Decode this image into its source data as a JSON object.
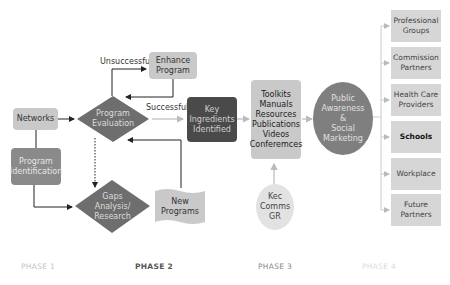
{
  "diagram": {
    "phase1": {
      "networks": "Networks",
      "program_identification": [
        "Program",
        "Identification"
      ]
    },
    "phase2": {
      "program_evaluation": [
        "Program",
        "Evaluation"
      ],
      "enhance_program": [
        "Enhance",
        "Program"
      ],
      "gaps_analysis": [
        "Gaps",
        "Analysis/",
        "Research"
      ],
      "new_programs": [
        "New",
        "Programs"
      ],
      "key_ingredients": [
        "Key",
        "Ingredients",
        "Identified"
      ],
      "label_unsuccessful": "Unsuccessful",
      "label_successful": "Successful"
    },
    "phase3": {
      "resources_box": [
        "Toolkits",
        "Manuals",
        "Resources",
        "Publications",
        "Videos",
        "Conferemces"
      ],
      "kec_comms": [
        "Kec",
        "Comms",
        "GR"
      ],
      "public_awareness": [
        "Public",
        "Awareness",
        "&",
        "Social",
        "Marketing"
      ]
    },
    "phase4": {
      "targets": [
        [
          "Professional",
          "Groups"
        ],
        [
          "Commission",
          "Partners"
        ],
        [
          "Health Care",
          "Providers"
        ],
        [
          "Schools"
        ],
        [
          "Workplace"
        ],
        [
          "Future",
          "Partners"
        ]
      ]
    },
    "phases": [
      "PHASE 1",
      "PHASE 2",
      "PHASE 3",
      "PHASE 4"
    ]
  },
  "colors": {
    "light_box": "#c9c9c9",
    "mid_box": "#8a8a8a",
    "dark_box": "#4a4a4a",
    "diamond": "#6e6e6e",
    "target_box": "#d6d6d6"
  }
}
